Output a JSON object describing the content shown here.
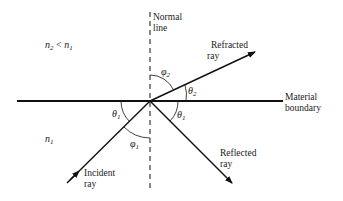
{
  "diagram": {
    "type": "ray-optics-refraction-reflection",
    "labels": {
      "normal_line_1": "Normal",
      "normal_line_2": "line",
      "refracted_ray_1": "Refracted",
      "refracted_ray_2": "ray",
      "reflected_ray_1": "Reflected",
      "reflected_ray_2": "ray",
      "incident_ray_1": "Incident",
      "incident_ray_2": "ray",
      "boundary_1": "Material",
      "boundary_2": "boundary"
    },
    "media": {
      "upper": {
        "n": "n",
        "n_sub": "2",
        "rel": " < ",
        "n2": "n",
        "n2_sub": "1"
      },
      "lower": {
        "n": "n",
        "n_sub": "1"
      }
    },
    "angles": {
      "phi2": {
        "sym": "φ",
        "sub": "2"
      },
      "theta2": {
        "sym": "θ",
        "sub": "2"
      },
      "theta1_left": {
        "sym": "θ",
        "sub": "1"
      },
      "theta1_right": {
        "sym": "θ",
        "sub": "1"
      },
      "phi1": {
        "sym": "φ",
        "sub": "1"
      }
    },
    "colors": {
      "line": "#111111",
      "background": "#ffffff"
    }
  }
}
